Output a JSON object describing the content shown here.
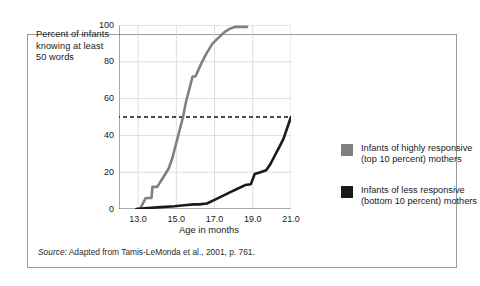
{
  "figure": {
    "y_axis_caption": "Percent of infants knowing at least 50 words",
    "x_axis_title": "Age in months",
    "source_lead": "Source:",
    "source_text": " Adapted from Tamis-LeMonda et al., 2001, p. 761."
  },
  "legend": {
    "position": "right-outside",
    "entries": [
      {
        "label": "Infants of highly responsive (top 10 percent) mothers",
        "color": "#808080",
        "swatch_name": "legend-swatch-highly-responsive"
      },
      {
        "label": "Infants of less responsive (bottom 10 percent) mothers",
        "color": "#1a1a1a",
        "swatch_name": "legend-swatch-less-responsive"
      }
    ]
  },
  "chart_data": {
    "type": "line",
    "title": "",
    "xlabel": "Age in months",
    "ylabel": "Percent of infants knowing at least 50 words",
    "xlim": [
      12.0,
      21.0
    ],
    "ylim": [
      0,
      100
    ],
    "xticks": [
      "13.0",
      "15.0",
      "17.0",
      "19.0",
      "21.0"
    ],
    "xtick_values": [
      13.0,
      15.0,
      17.0,
      19.0,
      21.0
    ],
    "yticks": [
      "0",
      "20",
      "40",
      "60",
      "80",
      "100"
    ],
    "ytick_values": [
      0,
      20,
      40,
      60,
      80,
      100
    ],
    "grid": true,
    "reference_line": {
      "y": 50,
      "style": "dashed",
      "color": "#111111"
    },
    "series": [
      {
        "name": "Infants of highly responsive (top 10 percent) mothers",
        "color": "#808080",
        "x": [
          12.9,
          13.1,
          13.4,
          13.7,
          13.75,
          14.0,
          14.3,
          14.6,
          14.8,
          15.0,
          15.15,
          15.35,
          15.5,
          15.7,
          15.85,
          16.0,
          16.3,
          16.6,
          16.9,
          17.2,
          17.5,
          17.8,
          18.1,
          18.4,
          18.7
        ],
        "y": [
          0,
          0,
          6,
          6,
          12,
          12,
          17,
          22,
          28,
          36,
          42,
          50,
          58,
          66,
          72,
          72,
          79,
          85,
          90,
          93,
          96,
          98,
          99,
          99,
          99
        ]
      },
      {
        "name": "Infants of less responsive (bottom 10 percent) mothers",
        "color": "#1a1a1a",
        "x": [
          12.9,
          13.5,
          14.2,
          14.9,
          15.4,
          15.9,
          16.2,
          16.6,
          17.0,
          17.4,
          17.8,
          18.2,
          18.6,
          18.9,
          19.1,
          19.4,
          19.7,
          19.9,
          20.1,
          20.35,
          20.6,
          20.8,
          21.0
        ],
        "y": [
          0,
          0.5,
          1,
          1.5,
          2,
          2.5,
          2.5,
          3,
          5,
          7,
          9,
          11,
          13,
          13.5,
          19,
          20,
          21,
          24,
          28,
          33,
          38,
          44,
          50
        ]
      }
    ]
  }
}
